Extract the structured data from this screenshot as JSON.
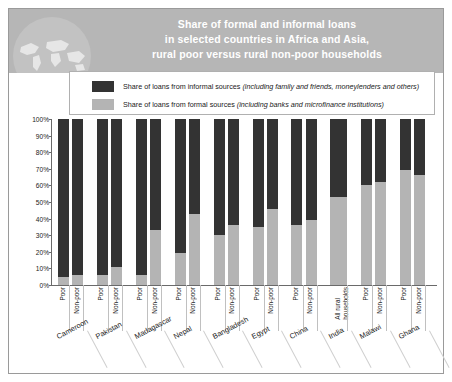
{
  "header": {
    "title_line1": "Share of formal and informal loans",
    "title_line2": "in selected countries in Africa and Asia,",
    "title_line3": "rural poor versus rural non-poor households",
    "globe_icon": "world-map-icon",
    "band_color": "#b6b6b6",
    "title_color": "#ffffff"
  },
  "legend": {
    "items": [
      {
        "swatch": "#333333",
        "label_main": "Share of loans from informal sources ",
        "label_italic": "(including family and friends, moneylenders and others)"
      },
      {
        "swatch": "#b4b4b4",
        "label_main": "Share of loans from formal sources ",
        "label_italic": "(including banks and microfinance institutions)"
      }
    ]
  },
  "chart_data": {
    "type": "bar",
    "subtype": "stacked-100-percent",
    "title": "Share of formal and informal loans in selected countries in Africa and Asia, rural poor versus rural non-poor households",
    "xlabel": "",
    "ylabel": "",
    "ylim": [
      0,
      100
    ],
    "ytick_labels": [
      "0%",
      "10%",
      "20%",
      "30%",
      "40%",
      "50%",
      "60%",
      "70%",
      "80%",
      "90%",
      "100%"
    ],
    "ytick_values": [
      0,
      10,
      20,
      30,
      40,
      50,
      60,
      70,
      80,
      90,
      100
    ],
    "grid": false,
    "legend_position": "top",
    "series": [
      {
        "name": "Share of loans from formal sources",
        "color": "#b4b4b4"
      },
      {
        "name": "Share of loans from informal sources",
        "color": "#333333"
      }
    ],
    "groups": [
      {
        "country": "Cameroon",
        "bars": [
          {
            "category": "Poor",
            "formal": 5,
            "informal": 95
          },
          {
            "category": "Non-poor",
            "formal": 6,
            "informal": 94
          }
        ]
      },
      {
        "country": "Pakistan",
        "bars": [
          {
            "category": "Poor",
            "formal": 6,
            "informal": 94
          },
          {
            "category": "Non-poor",
            "formal": 11,
            "informal": 89
          }
        ]
      },
      {
        "country": "Madagascar",
        "bars": [
          {
            "category": "Poor",
            "formal": 6,
            "informal": 94
          },
          {
            "category": "Non-poor",
            "formal": 33,
            "informal": 67
          }
        ]
      },
      {
        "country": "Nepal",
        "bars": [
          {
            "category": "Poor",
            "formal": 19,
            "informal": 81
          },
          {
            "category": "Non-poor",
            "formal": 43,
            "informal": 57
          }
        ]
      },
      {
        "country": "Bangladesh",
        "bars": [
          {
            "category": "Poor",
            "formal": 30,
            "informal": 70
          },
          {
            "category": "Non-poor",
            "formal": 36,
            "informal": 64
          }
        ]
      },
      {
        "country": "Egypt",
        "bars": [
          {
            "category": "Poor",
            "formal": 35,
            "informal": 65
          },
          {
            "category": "Non-poor",
            "formal": 46,
            "informal": 54
          }
        ]
      },
      {
        "country": "China",
        "bars": [
          {
            "category": "Poor",
            "formal": 36,
            "informal": 64
          },
          {
            "category": "Non-poor",
            "formal": 39,
            "informal": 61
          }
        ]
      },
      {
        "country": "India",
        "bars": [
          {
            "category": "All rural households",
            "formal": 53,
            "informal": 47
          }
        ]
      },
      {
        "country": "Malawi",
        "bars": [
          {
            "category": "Poor",
            "formal": 60,
            "informal": 40
          },
          {
            "category": "Non-poor",
            "formal": 62,
            "informal": 38
          }
        ]
      },
      {
        "country": "Ghana",
        "bars": [
          {
            "category": "Poor",
            "formal": 69,
            "informal": 31
          },
          {
            "category": "Non-poor",
            "formal": 66,
            "informal": 34
          }
        ]
      }
    ]
  }
}
